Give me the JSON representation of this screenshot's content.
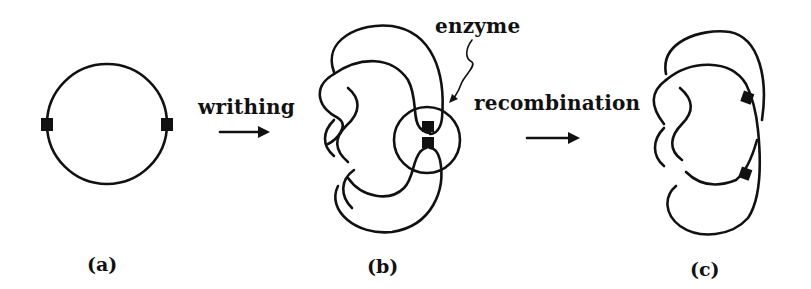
{
  "figure": {
    "panels": [
      {
        "id": "a",
        "label": "(a)",
        "description": "circular DNA with two recombination sites"
      },
      {
        "id": "b",
        "label": "(b)",
        "description": "writhed DNA with sites held together by enzyme"
      },
      {
        "id": "c",
        "label": "(c)",
        "description": "knotted DNA after recombination"
      }
    ],
    "steps": [
      {
        "label": "writhing",
        "from": "a",
        "to": "b"
      },
      {
        "label": "recombination",
        "from": "b",
        "to": "c"
      }
    ],
    "annotations": [
      {
        "label": "enzyme",
        "target": "circle around sites in (b)"
      }
    ],
    "colors": {
      "ink": "#111111",
      "background": "#ffffff"
    }
  }
}
